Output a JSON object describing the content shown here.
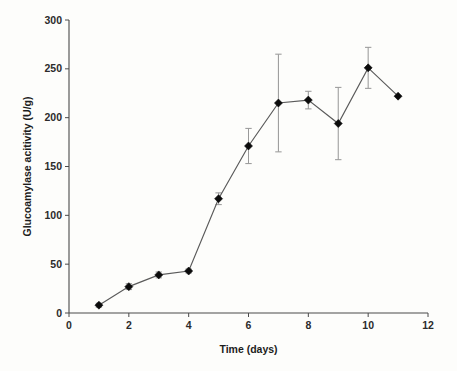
{
  "figure": {
    "background_color": "#fdfdfb",
    "marker_color": "#0b0b0b",
    "line_color": "#5a5a5a",
    "error_bar_color": "#9a9a9a",
    "axis_color": "#4a4a4a"
  },
  "chart_data": {
    "type": "line",
    "title": "",
    "xlabel": "Time (days)",
    "ylabel": "Glucoamylase acitivity (U/g)",
    "xlim": [
      0,
      12
    ],
    "ylim": [
      0,
      300
    ],
    "xticks": [
      0,
      2,
      4,
      6,
      8,
      10,
      12
    ],
    "xtick_labels": [
      "0",
      "2",
      "4",
      "6",
      "8",
      "10",
      "12"
    ],
    "yticks": [
      0,
      50,
      100,
      150,
      200,
      250,
      300
    ],
    "ytick_labels": [
      "0",
      "50",
      "100",
      "150",
      "200",
      "250",
      "300"
    ],
    "grid": false,
    "legend": null,
    "marker": "diamond",
    "x": [
      1,
      2,
      3,
      4,
      5,
      6,
      7,
      8,
      9,
      10,
      11
    ],
    "values": [
      8,
      27,
      39,
      43,
      117,
      171,
      215,
      218,
      194,
      251,
      222
    ],
    "errors": [
      2,
      3,
      3,
      2,
      6,
      18,
      50,
      9,
      37,
      21,
      0
    ],
    "series": [
      {
        "name": "Glucoamylase activity",
        "values": [
          8,
          27,
          39,
          43,
          117,
          171,
          215,
          218,
          194,
          251,
          222
        ],
        "errors": [
          2,
          3,
          3,
          2,
          6,
          18,
          50,
          9,
          37,
          21,
          0
        ]
      }
    ]
  }
}
